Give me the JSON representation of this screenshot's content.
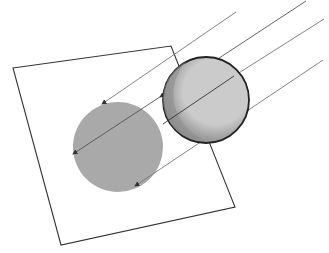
{
  "diagram": {
    "top_text_fragment": "",
    "colors": {
      "plane_stroke": "#333333",
      "ray_stroke": "#888888",
      "shadow_fill": "#a8a8a8",
      "sphere_lit": "#c8c8c8",
      "sphere_dark": "#8e8e8e",
      "sphere_outline": "#222222"
    },
    "elements": [
      {
        "name": "plane",
        "label": "projection plane"
      },
      {
        "name": "sphere",
        "label": "illuminated sphere"
      },
      {
        "name": "shadow",
        "label": "circular shadow"
      },
      {
        "name": "light-rays",
        "label": "parallel light rays",
        "count": 4
      }
    ]
  }
}
